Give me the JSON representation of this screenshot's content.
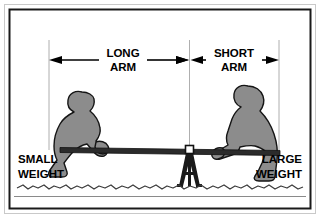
{
  "diagram": {
    "background_color": "#ffffff",
    "border_color": "#1a1a1a",
    "outer_frame_color": "#b8b8b8",
    "figure_fill_color": "#8c8c8c",
    "figure_outline_color": "#111111",
    "bar_color": "#2b2b2b",
    "fulcrum_color": "#1a1a1a",
    "pivot_color": "#ffffff",
    "ground_color": "#3d3d3d"
  },
  "dimensions": {
    "long_arm": {
      "label_line1": "LONG",
      "label_line2": "ARM",
      "start_x": 49,
      "end_x": 189,
      "y": 60
    },
    "short_arm": {
      "label_line1": "SHORT",
      "label_line2": "ARM",
      "start_x": 189,
      "end_x": 279,
      "y": 60
    }
  },
  "weights": {
    "left": {
      "label_line1": "SMALL",
      "label_line2": "WEIGHT",
      "x": 18,
      "y_line1": 162,
      "y_line2": 177
    },
    "right": {
      "label_line1": "LARGE",
      "label_line2": "WEIGHT",
      "x": 261,
      "y_line1": 162,
      "y_line2": 177
    }
  },
  "fulcrum": {
    "name": "tripod-fulcrum",
    "pivot_x": 189,
    "pivot_y": 152,
    "base_y": 186
  },
  "lever_bar": {
    "left_x": 60,
    "left_y": 150,
    "right_x": 280,
    "right_y": 153,
    "thickness": 5
  },
  "ground": {
    "squiggle_y": 187,
    "baseline_y": 196
  }
}
